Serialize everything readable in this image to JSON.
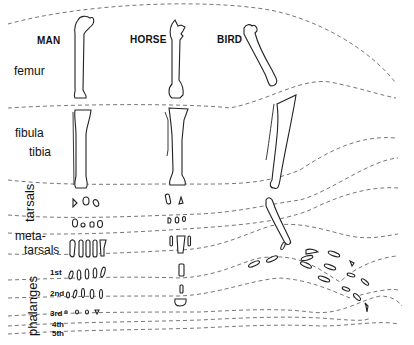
{
  "figure": {
    "type": "comparative-anatomy-diagram",
    "columns": [
      {
        "id": "man",
        "label": "MAN"
      },
      {
        "id": "horse",
        "label": "HORSE"
      },
      {
        "id": "bird",
        "label": "BIRD"
      }
    ],
    "rows": {
      "femur": "femur",
      "fibula": "fibula",
      "tibia": "tibia",
      "tarsals": "tarsals",
      "metatarsals_1": "meta-",
      "metatarsals_2": "tarsals",
      "phalanges": "phalanges"
    },
    "phalanx_rows": [
      "1st",
      "2nd",
      "3rd",
      "4th",
      "5th"
    ],
    "colors": {
      "background": "#ffffff",
      "ink": "#222222",
      "dashed_boundary": "#777777"
    }
  }
}
